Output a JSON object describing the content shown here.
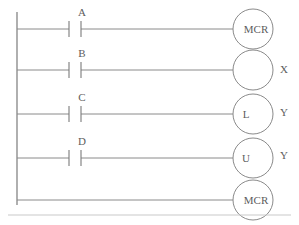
{
  "diagram": {
    "type": "ladder-logic-diagram",
    "title": "",
    "background_color": "#ffffff",
    "line_color": "#8a8a8a",
    "text_color": "#5d5d5d",
    "left_rail": {
      "x": 17,
      "y_top": 12,
      "y_bottom": 205
    },
    "bottom_border": {
      "y": 215,
      "x_start": 8,
      "x_end": 291
    },
    "contact_x": 75,
    "coil_center_x": 253,
    "coil_radius": 20,
    "rungs": [
      {
        "index": 1,
        "y": 29,
        "contact": {
          "label": "A",
          "kind": "normally-open-contact",
          "x": 75
        },
        "coil": {
          "inner_label": "MCR",
          "side_label": "",
          "kind": "coil"
        }
      },
      {
        "index": 2,
        "y": 70,
        "contact": {
          "label": "B",
          "kind": "normally-open-contact",
          "x": 75
        },
        "coil": {
          "inner_label": "",
          "side_label": "X",
          "kind": "coil"
        }
      },
      {
        "index": 3,
        "y": 114,
        "contact": {
          "label": "C",
          "kind": "normally-open-contact",
          "x": 75
        },
        "coil": {
          "inner_label": "L",
          "side_label": "Y",
          "kind": "latch-coil"
        }
      },
      {
        "index": 4,
        "y": 158,
        "contact": {
          "label": "D",
          "kind": "normally-open-contact",
          "x": 75
        },
        "coil": {
          "inner_label": "U",
          "side_label": "Y",
          "kind": "unlatch-coil"
        }
      },
      {
        "index": 5,
        "y": 200,
        "contact": null,
        "coil": {
          "inner_label": "MCR",
          "side_label": "",
          "kind": "coil"
        }
      }
    ]
  }
}
